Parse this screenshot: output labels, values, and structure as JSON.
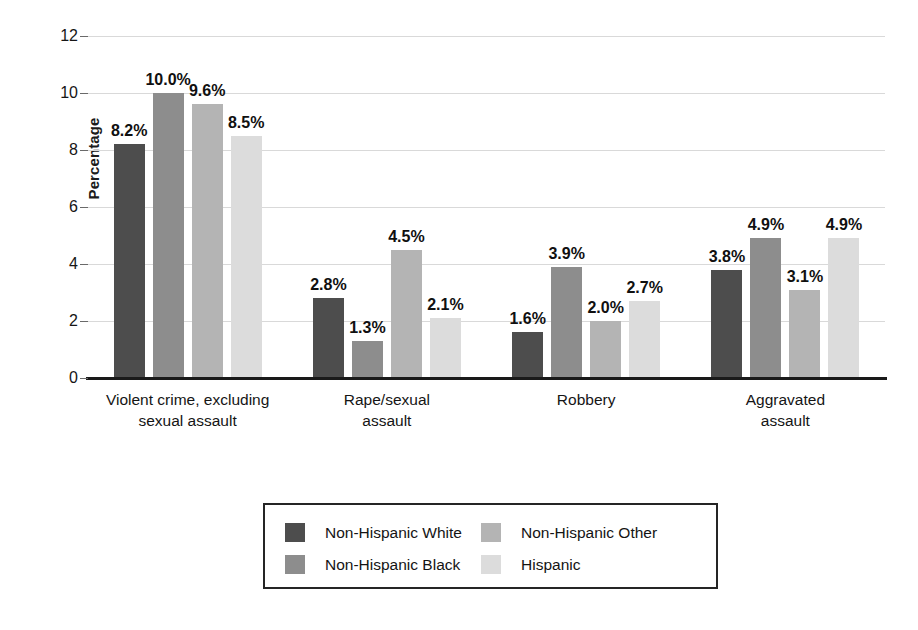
{
  "chart_data": {
    "type": "bar",
    "title": "",
    "subtitle": "",
    "xlabel": "",
    "ylabel": "Percentage",
    "ylim": [
      0,
      12
    ],
    "yticks": [
      0,
      2,
      4,
      6,
      8,
      10,
      12
    ],
    "ytick_labels": [
      "0",
      "2",
      "4",
      "6",
      "8",
      "10",
      "12"
    ],
    "grid": true,
    "legend_position": "bottom",
    "categories": [
      "Violent crime, excluding sexual assault",
      "Rape/sexual assault",
      "Robbery",
      "Aggravated assault"
    ],
    "category_lines": [
      [
        "Violent crime, excluding",
        "sexual assault"
      ],
      [
        "Rape/sexual",
        "assault"
      ],
      [
        "Robbery",
        ""
      ],
      [
        "Aggravated",
        "assault"
      ]
    ],
    "series": [
      {
        "name": "Non-Hispanic White",
        "color": "#4d4d4d",
        "values": [
          8.2,
          2.8,
          1.6,
          3.8
        ],
        "labels": [
          "8.2%",
          "2.8%",
          "1.6%",
          "3.8%"
        ]
      },
      {
        "name": "Non-Hispanic Black",
        "color": "#8d8d8d",
        "values": [
          10.0,
          1.3,
          3.9,
          4.9
        ],
        "labels": [
          "10.0%",
          "1.3%",
          "3.9%",
          "4.9%"
        ]
      },
      {
        "name": "Non-Hispanic Other",
        "color": "#b4b4b4",
        "values": [
          9.6,
          4.5,
          2.0,
          3.1
        ],
        "labels": [
          "9.6%",
          "4.5%",
          "2.0%",
          "3.1%"
        ]
      },
      {
        "name": "Hispanic",
        "color": "#dcdcdc",
        "values": [
          8.5,
          2.1,
          2.7,
          4.9
        ],
        "labels": [
          "8.5%",
          "2.1%",
          "2.7%",
          "4.9%"
        ]
      }
    ]
  },
  "axis": {
    "y_title": "Percentage",
    "y_ticks": [
      {
        "label": "12"
      },
      {
        "label": "10"
      },
      {
        "label": "8"
      },
      {
        "label": "6"
      },
      {
        "label": "4"
      },
      {
        "label": "2"
      },
      {
        "label": "0"
      }
    ]
  },
  "categories": [
    {
      "line1": "Violent crime, excluding",
      "line2": "sexual assault"
    },
    {
      "line1": "Rape/sexual",
      "line2": "assault"
    },
    {
      "line1": "Robbery",
      "line2": ""
    },
    {
      "line1": "Aggravated",
      "line2": "assault"
    }
  ],
  "legend": {
    "entries": [
      {
        "label": "Non-Hispanic White",
        "color": "#4d4d4d"
      },
      {
        "label": "Non-Hispanic Black",
        "color": "#8d8d8d"
      },
      {
        "label": "Non-Hispanic Other",
        "color": "#b4b4b4"
      },
      {
        "label": "Hispanic",
        "color": "#dcdcdc"
      }
    ]
  },
  "bar_labels": {
    "g0": [
      "8.2%",
      "10.0%",
      "9.6%",
      "8.5%"
    ],
    "g1": [
      "2.8%",
      "1.3%",
      "4.5%",
      "2.1%"
    ],
    "g2": [
      "1.6%",
      "3.9%",
      "2.0%",
      "2.7%"
    ],
    "g3": [
      "3.8%",
      "4.9%",
      "3.1%",
      "4.9%"
    ]
  }
}
